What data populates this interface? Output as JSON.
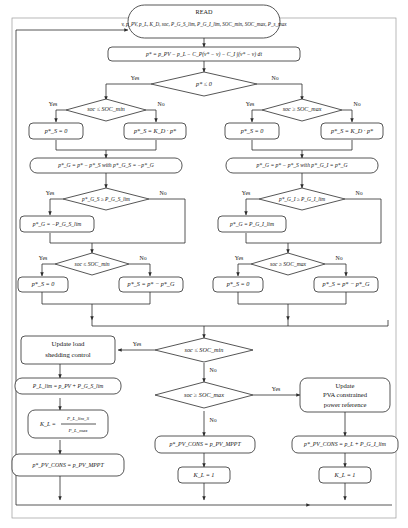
{
  "diagram": {
    "colors": {
      "stroke": "#2b2b2b",
      "fill": "#ffffff",
      "text": "#141414"
    },
    "labels": {
      "yes": "Yes",
      "no": "No"
    },
    "nodes": {
      "read": {
        "line1": "READ",
        "line2": "v, p_PV, p_L, K_D, soc, P_G_S_lim, P_G_I_lim, SOC_min, SOC_max, P_s_max"
      },
      "pstar": {
        "text": "p* = p_PV − p_L − C_P(v* − v) − C_I ∫(v* − v) dt"
      },
      "d_pstar": {
        "text": "p* ≤ 0"
      },
      "d_soc_min_l": {
        "text": "soc ≤ SOC_min"
      },
      "d_soc_max_r": {
        "text": "soc ≥ SOC_max"
      },
      "ps_zero_l": {
        "text": "p*_S = 0"
      },
      "ps_kd_l": {
        "text": "p*_S = K_D · p*"
      },
      "ps_zero_r": {
        "text": "p*_S = 0"
      },
      "ps_kd_r": {
        "text": "p*_S = K_D · p*"
      },
      "pg_l": {
        "text": "p*_G = p* − p*_S with p*_G_S = −p*_G"
      },
      "pg_r": {
        "text": "p*_G = p* − p*_S with p*_G_I = p*_G"
      },
      "d_lim_l": {
        "text": "p*_G_S ≥ P_G_S_lim"
      },
      "d_lim_r": {
        "text": "p*_G_I ≥ P_G_I_lim"
      },
      "pg_lim_l": {
        "text": "p*_G = −P_G_S_lim"
      },
      "pg_lim_r": {
        "text": "p*_G = P_G_I_lim"
      },
      "d_soc_min_l2": {
        "text": "soc ≤ SOC_min"
      },
      "d_soc_max_r2": {
        "text": "soc ≥ SOC_max"
      },
      "ps_zero_l2": {
        "text": "p*_S = 0"
      },
      "ps_diff_l2": {
        "text": "p*_S = p* − p*_G"
      },
      "ps_zero_r2": {
        "text": "p*_S = 0"
      },
      "ps_diff_r2": {
        "text": "p*_S = p* − p*_G"
      },
      "d_soc_min_bot": {
        "text": "soc ≤ SOC_min"
      },
      "d_soc_max_bot": {
        "text": "soc ≥ SOC_max"
      },
      "update_load": {
        "line1": "Update load",
        "line2": "shedding control"
      },
      "update_pva": {
        "line1": "Update",
        "line2": "PVA constrained",
        "line3": "power reference"
      },
      "pl_lim": {
        "text": "P_L_lim = p_PV + P_G_S_lim"
      },
      "kl_frac": {
        "num": "P_L_lim_S",
        "den": "P_L_max",
        "lhs": "K_L ="
      },
      "ppv_cons_l": {
        "text": "p*_PV_CONS = p_PV_MPPT"
      },
      "ppv_cons_m": {
        "text": "p*_PV_CONS = p_PV_MPPT"
      },
      "ppv_cons_r": {
        "text": "p*_PV_CONS = p_L + P_G_I_lim"
      },
      "kl_one_m": {
        "text": "K_L = 1"
      },
      "kl_one_r": {
        "text": "K_L = 1"
      }
    }
  }
}
